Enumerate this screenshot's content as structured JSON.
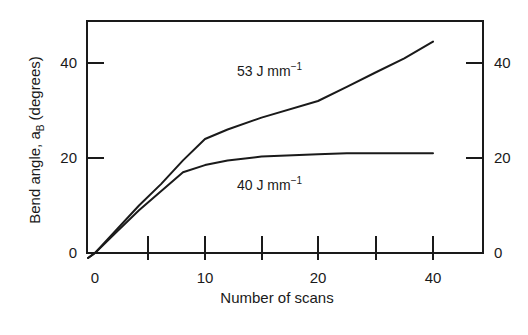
{
  "chart_data": {
    "type": "line",
    "title": "",
    "xlabel": "Number of scans",
    "ylabel": "Bend angle, α_B (degrees)",
    "ylabel_parts": {
      "main": "Bend angle, a",
      "sub": "B",
      "rest": " (degrees)"
    },
    "x_tick_labels": [
      "0",
      "10",
      "20",
      "40"
    ],
    "y_tick_labels": [
      "0",
      "20",
      "40"
    ],
    "y2_tick_labels": [
      "0",
      "20",
      "40"
    ],
    "ylim": [
      0,
      48
    ],
    "grid": false,
    "legend": "inline labels",
    "series": [
      {
        "name": "53 J mm−1",
        "label_main": "53 J mm",
        "label_sup": "−1",
        "x": [
          0,
          2,
          4,
          6,
          8,
          10,
          12,
          15,
          20,
          25,
          30,
          35,
          40
        ],
        "values": [
          0,
          5,
          10,
          14.5,
          19.5,
          24,
          26,
          28.5,
          32,
          35,
          38,
          41,
          44.5
        ]
      },
      {
        "name": "40 J mm−1",
        "label_main": "40 J mm",
        "label_sup": "−1",
        "x": [
          0,
          2,
          4,
          6,
          8,
          10,
          12,
          15,
          20,
          25,
          30,
          35,
          40
        ],
        "values": [
          0,
          4.5,
          9,
          13,
          17,
          18.5,
          19.5,
          20.3,
          20.8,
          21,
          21,
          21,
          21
        ]
      }
    ]
  },
  "colors": {
    "line": "#1a1a1a",
    "background": "#ffffff"
  }
}
